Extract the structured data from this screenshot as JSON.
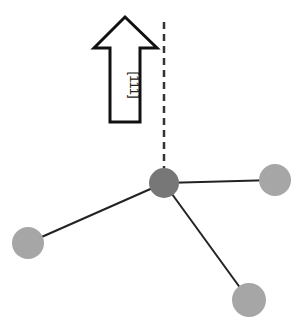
{
  "diagram": {
    "arrow": {
      "label": "[111]",
      "direction": "up"
    },
    "axis": {
      "style": "dashed",
      "color": "#333333"
    },
    "atoms": {
      "center": {
        "role": "central-atom",
        "color": "#777777"
      },
      "neighbors": [
        {
          "position": "right",
          "color": "#a6a6a6"
        },
        {
          "position": "left",
          "color": "#a6a6a6"
        },
        {
          "position": "bottom-right",
          "color": "#a6a6a6"
        }
      ]
    },
    "bond_color": "#222222"
  }
}
